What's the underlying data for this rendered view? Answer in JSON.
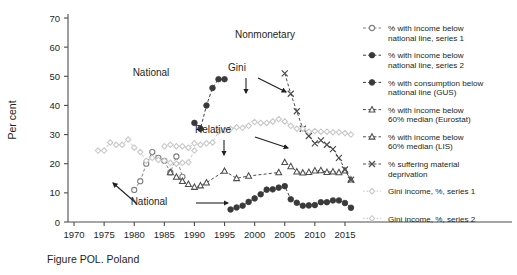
{
  "caption": "Figure POL. Poland",
  "chart_data": {
    "type": "line",
    "title": "",
    "xlabel": "",
    "ylabel": "Per cent",
    "xlim": [
      1969,
      2017
    ],
    "ylim": [
      0,
      70
    ],
    "xticks": [
      1970,
      1975,
      1980,
      1985,
      1990,
      1995,
      2000,
      2005,
      2010,
      2015
    ],
    "yticks": [
      0,
      10,
      20,
      30,
      40,
      50,
      60,
      70
    ],
    "grid": false,
    "legend_position": "right",
    "series": [
      {
        "name": "% with income below national line, series 1",
        "key": "income_national_s1",
        "marker": "open-circle",
        "color": "#808080",
        "line": "dashed",
        "x": [
          1980,
          1981,
          1982,
          1983,
          1984,
          1985,
          1986,
          1987,
          1988
        ],
        "values": [
          11,
          14,
          20,
          24,
          22,
          21,
          17,
          22.5,
          15.5
        ]
      },
      {
        "name": "% with income below national line, series 2",
        "key": "income_national_s2",
        "marker": "filled-circle",
        "color": "#3a3a3a",
        "line": "dashed",
        "x": [
          1996,
          1997,
          1998,
          1999,
          2000,
          2001,
          2002,
          2003,
          2004,
          2005,
          2006,
          2007,
          2008,
          2009,
          2010,
          2011,
          2012,
          2013,
          2014,
          2015,
          2016
        ],
        "values": [
          4.3,
          5.0,
          5.6,
          6.9,
          8.1,
          9.5,
          11.1,
          11.2,
          11.8,
          12.3,
          7.8,
          6.6,
          5.6,
          5.7,
          5.8,
          6.8,
          6.8,
          7.4,
          7.4,
          6.5,
          4.9
        ]
      },
      {
        "name": "% with consumption below national line (GUS)",
        "key": "consumption_national_gus",
        "marker": "filled-circle",
        "color": "#3a3a3a",
        "line": "dashed",
        "x": [
          1990,
          1991,
          1992,
          1993,
          1994,
          1995
        ],
        "values": [
          34,
          32,
          40,
          46,
          49,
          49
        ]
      },
      {
        "name": "% with income below 60% median (Eurostat)",
        "key": "income_60_median_eurostat",
        "marker": "open-triangle",
        "color": "#4d4d4d",
        "line": "dashed",
        "x": [
          2005,
          2006,
          2007,
          2008,
          2009,
          2010,
          2011,
          2012,
          2013,
          2014,
          2015,
          2016
        ],
        "values": [
          20.5,
          19.1,
          17.3,
          16.9,
          17.1,
          17.6,
          17.7,
          17.1,
          17.3,
          17.0,
          17.6,
          14.5
        ]
      },
      {
        "name": "% with income below 60% median (LIS)",
        "key": "income_60_median_lis",
        "marker": "open-triangle",
        "color": "#4d4d4d",
        "line": "dashed",
        "x": [
          1986,
          1987,
          1988,
          1989,
          1990,
          1991,
          1992,
          1995,
          1997,
          1999,
          2004
        ],
        "values": [
          17,
          15.5,
          14,
          13,
          12,
          12.5,
          13.5,
          17.5,
          15,
          15.8,
          17
        ]
      },
      {
        "name": "% suffering material deprivation",
        "key": "material_deprivation",
        "marker": "cross",
        "color": "#4d4d4d",
        "line": "dashed",
        "x": [
          2005,
          2006,
          2007,
          2008,
          2009,
          2010,
          2011,
          2012,
          2013,
          2014,
          2015,
          2016
        ],
        "values": [
          51,
          44,
          38,
          32,
          29.5,
          27,
          28,
          26.5,
          25,
          22,
          18,
          14.5
        ]
      },
      {
        "name": "Gini income, %, series 1",
        "key": "gini_s1",
        "marker": "light-diamond",
        "color": "#c8c8c8",
        "line": "dashed",
        "x": [
          1974,
          1975,
          1976,
          1977,
          1978,
          1979,
          1980,
          1981,
          1982,
          1983,
          1984,
          1985,
          1986,
          1987,
          1988,
          1989,
          1990
        ],
        "values": [
          24.5,
          24.5,
          27.3,
          26.5,
          26.5,
          28.3,
          25.5,
          24,
          21,
          22,
          21.3,
          21,
          20.3,
          20,
          20.3,
          20.5,
          24.5
        ]
      },
      {
        "name": "Gini income, %, series 2",
        "key": "gini_s2",
        "marker": "light-diamond",
        "color": "#c8c8c8",
        "line": "dashed",
        "x": [
          1985,
          1986,
          1987,
          1988,
          1989,
          1990,
          1991,
          1992,
          1993,
          1994,
          1995,
          1996,
          1997,
          1998,
          1999,
          2000,
          2001,
          2002,
          2003,
          2004,
          2005,
          2006,
          2007,
          2008,
          2009,
          2010,
          2011,
          2012,
          2013,
          2014,
          2015,
          2016
        ],
        "values": [
          26,
          26.5,
          26,
          26,
          25.5,
          27,
          26.5,
          27,
          27.3,
          31,
          31.5,
          32,
          32.5,
          32.3,
          33,
          34.3,
          34,
          34,
          34.5,
          35.3,
          34.5,
          33,
          32,
          32,
          31,
          31.2,
          31,
          31,
          30.8,
          30.8,
          30.5,
          30
        ]
      }
    ],
    "annotations": [
      {
        "key": "national_upper",
        "label": "National",
        "x": 151,
        "y": 76
      },
      {
        "key": "national_lower",
        "label": "National",
        "x": 149,
        "y": 205
      },
      {
        "key": "gini",
        "label": "Gini",
        "x": 237,
        "y": 71
      },
      {
        "key": "relative",
        "label": "Relative",
        "x": 213,
        "y": 133
      },
      {
        "key": "nonmonetary",
        "label": "Nonmonetary",
        "x": 265,
        "y": 38
      }
    ]
  },
  "legend": {
    "items": [
      {
        "label_line1": "% with income below",
        "label_line2": "national line, series 1",
        "marker": "open-circle",
        "color": "#808080"
      },
      {
        "label_line1": "% with income below",
        "label_line2": "national line, series 2",
        "marker": "filled-circle",
        "color": "#3a3a3a"
      },
      {
        "label_line1": "% with consumption below",
        "label_line2": "national line (GUS)",
        "marker": "filled-circle",
        "color": "#3a3a3a"
      },
      {
        "label_line1": "% with income below",
        "label_line2": "60% median (Eurostat)",
        "marker": "open-triangle",
        "color": "#4d4d4d"
      },
      {
        "label_line1": "% with income below",
        "label_line2": "60% median (LIS)",
        "marker": "open-triangle",
        "color": "#4d4d4d"
      },
      {
        "label_line1": "% suffering material",
        "label_line2": "deprivation",
        "marker": "cross",
        "color": "#4d4d4d"
      },
      {
        "label_line1": "Gini income, %, series 1",
        "label_line2": "",
        "marker": "light-diamond",
        "color": "#c8c8c8"
      },
      {
        "label_line1": "Gini income, %, series 2",
        "label_line2": "",
        "marker": "light-diamond",
        "color": "#c8c8c8"
      }
    ]
  }
}
